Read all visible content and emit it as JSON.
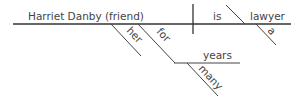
{
  "diagram": {
    "type": "sentence-diagram",
    "colors": {
      "line": "#333333",
      "text": "#444444",
      "background": "#ffffff"
    },
    "subject": "Harriet Danby (friend)",
    "verb": "is",
    "predicate_nominative": "lawyer",
    "modifiers": {
      "subject": [
        "her",
        "for"
      ],
      "predicate_nominative": [
        "a"
      ],
      "prepositional_object": "years",
      "object_modifier": "many"
    },
    "labels": {
      "subject": "Harriet Danby (friend)",
      "verb": "is",
      "predicate_nominative": "lawyer",
      "article": "a",
      "possessive": "her",
      "preposition": "for",
      "prep_object": "years",
      "adjective": "many"
    }
  }
}
